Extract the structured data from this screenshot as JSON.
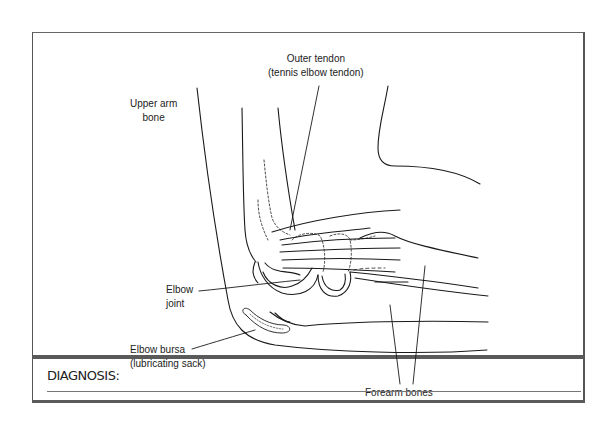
{
  "diagram": {
    "labels": {
      "outer_tendon_line1": "Outer tendon",
      "outer_tendon_line2": "(tennis elbow tendon)",
      "upper_arm_line1": "Upper arm",
      "upper_arm_line2": "bone",
      "elbow_joint_line1": "Elbow",
      "elbow_joint_line2": "joint",
      "bursa_line1": "Elbow bursa",
      "bursa_line2": "(lubricating sack)",
      "forearm_bones": "Forearm bones"
    }
  },
  "diagnosis": {
    "label": "DIAGNOSIS:",
    "value": ""
  },
  "colors": {
    "line": "#1a1a1a",
    "border": "#555555",
    "text": "#222222"
  }
}
